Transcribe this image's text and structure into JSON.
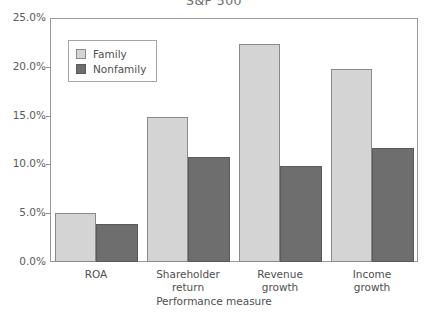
{
  "chart_data": {
    "type": "bar",
    "title": "S&P 500",
    "xlabel": "Performance measure",
    "ylabel": "",
    "categories": [
      "ROA",
      "Shareholder\nreturn",
      "Revenue\ngrowth",
      "Income\ngrowth"
    ],
    "series": [
      {
        "name": "Family",
        "values": [
          5.0,
          14.9,
          22.3,
          19.8
        ],
        "color": "#d4d4d4"
      },
      {
        "name": "Nonfamily",
        "values": [
          3.9,
          10.8,
          9.8,
          11.7
        ],
        "color": "#6e6e6e"
      }
    ],
    "ylim": [
      0,
      25
    ],
    "ytick_labels": [
      "0.0%",
      "5.0%",
      "10.0%",
      "15.0%",
      "20.0%",
      "25.0%"
    ],
    "ytick_values": [
      0,
      5,
      10,
      15,
      20,
      25
    ],
    "grid": false,
    "legend_position": "upper-left"
  }
}
